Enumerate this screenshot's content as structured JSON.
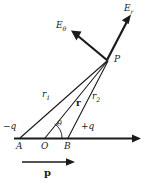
{
  "figure": {
    "background_color": "#ffffff",
    "stroke_color": "#1a1a1a",
    "width": 146,
    "height": 185
  },
  "labels": {
    "e_theta": "E",
    "e_theta_sub": "θ",
    "e_r": "E",
    "e_r_sub": "r",
    "point_p": "P",
    "r1": "r",
    "r1_sub": "1",
    "r_vector": "r",
    "r2": "r",
    "r2_sub": "2",
    "theta": "θ",
    "charge_negative": "−q",
    "charge_positive": "+q",
    "point_a": "A",
    "point_o": "O",
    "point_b": "B",
    "dipole_moment": "p"
  },
  "geometry": {
    "point_a": [
      20,
      138
    ],
    "point_o": [
      45,
      138
    ],
    "point_b": [
      68,
      138
    ],
    "point_p": [
      108,
      60
    ],
    "axis_start": [
      14,
      138
    ],
    "axis_end": [
      141,
      138
    ],
    "e_r_tip": [
      131,
      17
    ],
    "e_theta_tip": [
      72,
      32
    ],
    "dipole_arrow_start": [
      22,
      162
    ],
    "dipole_arrow_end": [
      74,
      162
    ],
    "theta_arc_radius": 17
  }
}
